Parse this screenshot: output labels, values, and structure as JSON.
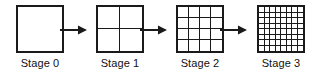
{
  "figure": {
    "background_color": "#ffffff",
    "line_color": "#1a1a1a",
    "text_color": "#111111"
  },
  "stages": [
    {
      "label": "Stage 0",
      "divisions": 1,
      "cells": 1
    },
    {
      "label": "Stage 1",
      "divisions": 2,
      "cells": 4
    },
    {
      "label": "Stage 2",
      "divisions": 4,
      "cells": 16
    },
    {
      "label": "Stage 3",
      "divisions": 8,
      "cells": 64
    }
  ],
  "arrows": [
    {
      "name": "arrow-stage0-to-stage1",
      "direction": "right"
    },
    {
      "name": "arrow-stage1-to-stage2",
      "direction": "right"
    },
    {
      "name": "arrow-stage2-to-stage3",
      "direction": "right"
    }
  ]
}
